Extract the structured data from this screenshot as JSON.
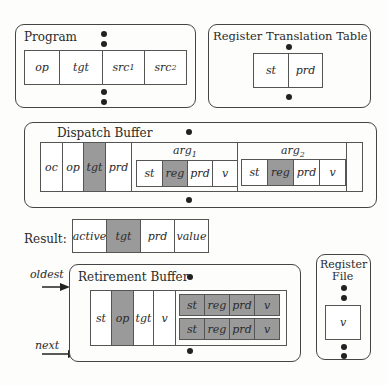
{
  "program": {
    "title": "Program",
    "fields": [
      "op",
      "tgt",
      "src1",
      "src2"
    ]
  },
  "rtt": {
    "title": "Register Translation Table",
    "fields": [
      "st",
      "prd"
    ]
  },
  "dispatch": {
    "title": "Dispatch Buffer",
    "fields": [
      "oc",
      "op",
      "tgt",
      "prd"
    ],
    "shaded_fields": [
      "tgt"
    ],
    "arg1": {
      "label": "arg1",
      "fields": [
        "st",
        "reg",
        "prd",
        "v"
      ],
      "shaded": [
        "reg"
      ]
    },
    "arg2": {
      "label": "arg2",
      "fields": [
        "st",
        "reg",
        "prd",
        "v"
      ],
      "shaded": [
        "reg"
      ]
    }
  },
  "result": {
    "label": "Result:",
    "fields": [
      "active",
      "tgt",
      "prd",
      "value"
    ],
    "shaded": [
      "tgt"
    ]
  },
  "retirement": {
    "title": "Retirement Buffer",
    "fields": [
      "st",
      "op",
      "tgt",
      "v"
    ],
    "shaded": [
      "op"
    ],
    "arg_rows": [
      [
        "st",
        "reg",
        "prd",
        "v"
      ],
      [
        "st",
        "reg",
        "prd",
        "v"
      ]
    ],
    "pointers": {
      "oldest": "oldest",
      "next": "next"
    }
  },
  "register_file": {
    "title_line1": "Register",
    "title_line2": "File",
    "field": "v"
  },
  "colors": {
    "shade": "#9a9a9a",
    "border": "#444444"
  }
}
